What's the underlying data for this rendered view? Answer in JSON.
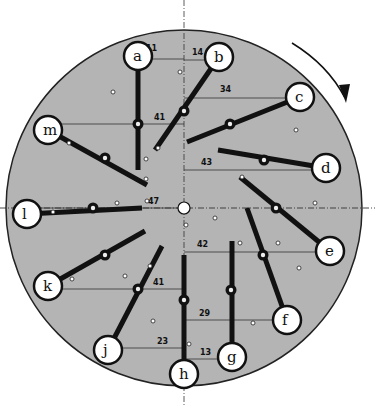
{
  "diagram": {
    "title": "",
    "disk": {
      "cx": 184,
      "cy": 208,
      "r": 178,
      "fill": "#b4b4b4",
      "stroke": "#222222"
    },
    "rotation_direction": "clockwise",
    "center_hub": {
      "cx": 184,
      "cy": 208,
      "r": 6
    },
    "arms": [
      {
        "id": "a",
        "label": "a",
        "circle": [
          138,
          56
        ],
        "end": [
          138,
          170
        ],
        "pivot": [
          138,
          124
        ],
        "measure_label": "11",
        "measure_y": 59,
        "label_pos": [
          146,
          51
        ]
      },
      {
        "id": "b",
        "label": "b",
        "circle": [
          219,
          57
        ],
        "end": [
          155,
          150
        ],
        "pivot": [
          184,
          111
        ],
        "measure_label": "14",
        "measure_y": 60,
        "label_pos": [
          192,
          55
        ]
      },
      {
        "id": "c",
        "label": "c",
        "circle": [
          300,
          97
        ],
        "end": [
          187,
          142
        ],
        "pivot": [
          230,
          124
        ],
        "measure_label": "34",
        "measure_y": 98,
        "label_pos": [
          220,
          92
        ]
      },
      {
        "id": "d",
        "label": "d",
        "circle": [
          326,
          168
        ],
        "end": [
          218,
          150
        ],
        "pivot": [
          264,
          160
        ],
        "measure_label": "43",
        "measure_y": 170,
        "label_pos": [
          201,
          165
        ]
      },
      {
        "id": "e",
        "label": "e",
        "circle": [
          330,
          251
        ],
        "end": [
          240,
          177
        ],
        "pivot": [
          276,
          208
        ],
        "measure_label": "42",
        "measure_y": 252,
        "label_pos": [
          197,
          247
        ]
      },
      {
        "id": "f",
        "label": "f",
        "circle": [
          287,
          320
        ],
        "end": [
          247,
          208
        ],
        "pivot": [
          263,
          255
        ],
        "measure_label": "29",
        "measure_y": 320,
        "label_pos": [
          199,
          316
        ]
      },
      {
        "id": "g",
        "label": "g",
        "circle": [
          232,
          357
        ],
        "end": [
          232,
          241
        ],
        "pivot": [
          231,
          290
        ],
        "measure_label": "13",
        "measure_y": 359,
        "label_pos": [
          200,
          355
        ]
      },
      {
        "id": "h",
        "label": "h",
        "circle": [
          184,
          374
        ],
        "end": [
          184,
          255
        ],
        "pivot": [
          184,
          300
        ],
        "measure_label": "",
        "measure_y": 0,
        "label_pos": [
          0,
          0
        ]
      },
      {
        "id": "j",
        "label": "j",
        "circle": [
          108,
          350
        ],
        "end": [
          162,
          246
        ],
        "pivot": [
          138,
          289
        ],
        "measure_label": "23",
        "measure_y": 348,
        "label_pos": [
          157,
          344
        ]
      },
      {
        "id": "k",
        "label": "k",
        "circle": [
          48,
          286
        ],
        "end": [
          145,
          231
        ],
        "pivot": [
          105,
          255
        ],
        "measure_label": "41",
        "measure_y": 289,
        "label_pos": [
          153,
          285
        ]
      },
      {
        "id": "l",
        "label": "l",
        "circle": [
          27,
          214
        ],
        "end": [
          142,
          208
        ],
        "pivot": [
          93,
          208
        ],
        "measure_label": "47",
        "measure_y": 208,
        "label_pos": [
          148,
          204
        ]
      },
      {
        "id": "m",
        "label": "m",
        "circle": [
          48,
          130
        ],
        "end": [
          147,
          185
        ],
        "pivot": [
          105,
          158
        ],
        "measure_label": "41",
        "measure_y": 124,
        "label_pos": [
          154,
          120
        ]
      }
    ],
    "pins": [
      [
        180,
        72
      ],
      [
        113,
        92
      ],
      [
        158,
        148
      ],
      [
        146,
        179
      ],
      [
        146,
        159
      ],
      [
        117,
        203
      ],
      [
        147,
        201
      ],
      [
        69,
        143
      ],
      [
        53,
        212
      ],
      [
        296,
        130
      ],
      [
        242,
        177
      ],
      [
        315,
        203
      ],
      [
        278,
        243
      ],
      [
        215,
        218
      ],
      [
        299,
        268
      ],
      [
        150,
        266
      ],
      [
        125,
        276
      ],
      [
        72,
        279
      ],
      [
        153,
        321
      ],
      [
        189,
        344
      ],
      [
        253,
        323
      ],
      [
        186,
        225
      ],
      [
        240,
        243
      ]
    ]
  }
}
